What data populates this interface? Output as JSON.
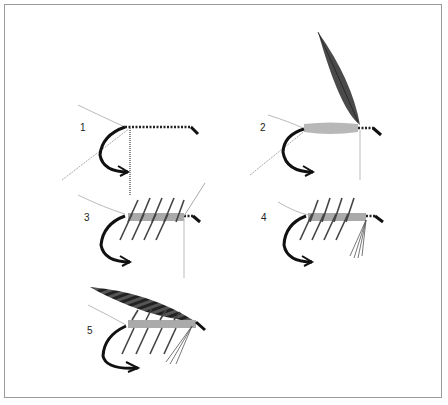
{
  "figure": {
    "steps": [
      {
        "number": "1",
        "label": "1",
        "stage": "thread wrapped on hook shank with tail, rib and hackle tied in"
      },
      {
        "number": "2",
        "label": "2",
        "stage": "body dubbed, wing feather tied in"
      },
      {
        "number": "3",
        "label": "3",
        "stage": "palmered hackle wound over body"
      },
      {
        "number": "4",
        "label": "4",
        "stage": "throat hackle added"
      },
      {
        "number": "5",
        "label": "5",
        "stage": "barred wing mounted, finished fly"
      }
    ]
  },
  "colors": {
    "border": "#9a9a9a",
    "hook": "#111111",
    "thread": "#222222",
    "body": "#b8b8b8",
    "wing": "#4a4a4a",
    "hackle": "#555555",
    "fiber": "#bbbbbb"
  }
}
